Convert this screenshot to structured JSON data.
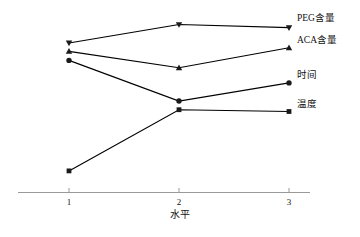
{
  "chart_data": {
    "type": "line",
    "title": "",
    "xlabel": "水平",
    "ylabel": "",
    "categories": [
      "1",
      "2",
      "3"
    ],
    "x": [
      1,
      2,
      3
    ],
    "xlim": [
      0.55,
      3.25
    ],
    "ylim": [
      0,
      100
    ],
    "grid": false,
    "legend_position": "right-inline",
    "axis": {
      "x_axis_visible": true,
      "y_axis_visible": false,
      "tick_labels": [
        "1",
        "2",
        "3"
      ]
    },
    "series": [
      {
        "name": "PEG含量",
        "marker": "triangle-down",
        "color": "#000000",
        "values": [
          83.1,
          93.3,
          91.6
        ]
      },
      {
        "name": "ACA含量",
        "marker": "triangle-up",
        "color": "#000000",
        "values": [
          78.4,
          69.3,
          80.4
        ]
      },
      {
        "name": "时间",
        "marker": "circle",
        "color": "#000000",
        "values": [
          73.4,
          50.8,
          60.9
        ]
      },
      {
        "name": "温度",
        "marker": "square",
        "color": "#000000",
        "values": [
          12.0,
          46.0,
          45.0
        ]
      }
    ]
  },
  "figure": {
    "caption": "",
    "axis_title": "水平",
    "labels": {
      "peg": "PEG含量",
      "aca": "ACA含量",
      "time": "时间",
      "temperature": "温度"
    },
    "ticks": {
      "t1": "1",
      "t2": "2",
      "t3": "3"
    },
    "colors": {
      "line": "#1a1a1a",
      "axis": "#9a9a9a",
      "text": "#111111"
    }
  }
}
